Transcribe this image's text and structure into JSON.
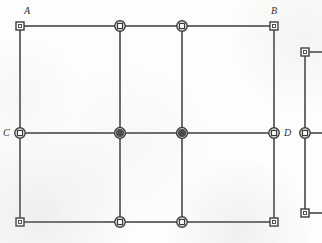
{
  "figure": {
    "kind": "structural-frame-diagram",
    "width": 322,
    "height": 243,
    "background_color": "#fdfdfc",
    "line_color": "#3a3a3a",
    "node_fill_color": "#ffffff",
    "node_filled_color": "#4a4a4a",
    "label_color": "#2e2e2e"
  },
  "labels": [
    {
      "text": "A",
      "x": 24,
      "y": 6,
      "anchor": "above-right"
    },
    {
      "text": "B",
      "x": 271,
      "y": 6,
      "anchor": "above-left"
    },
    {
      "text": "C",
      "x": 3,
      "y": 128,
      "anchor": "left"
    },
    {
      "text": "D",
      "x": 284,
      "y": 128,
      "anchor": "right"
    }
  ],
  "grid": {
    "column_x": [
      20,
      120,
      182,
      274
    ],
    "row_y": [
      26,
      133,
      222
    ]
  },
  "beams": [
    {
      "name": "beam-top",
      "x1": 20,
      "y1": 26,
      "x2": 274,
      "y2": 26
    },
    {
      "name": "beam-middle",
      "x1": 20,
      "y1": 133,
      "x2": 274,
      "y2": 133
    },
    {
      "name": "beam-bottom",
      "x1": 20,
      "y1": 222,
      "x2": 274,
      "y2": 222
    }
  ],
  "columns": [
    {
      "name": "column-1",
      "x1": 20,
      "y1": 26,
      "x2": 20,
      "y2": 222
    },
    {
      "name": "column-2",
      "x1": 120,
      "y1": 26,
      "x2": 120,
      "y2": 222
    },
    {
      "name": "column-3",
      "x1": 182,
      "y1": 26,
      "x2": 182,
      "y2": 222
    },
    {
      "name": "column-4",
      "x1": 274,
      "y1": 26,
      "x2": 274,
      "y2": 222
    }
  ],
  "nodes": [
    {
      "name": "node-A",
      "x": 20,
      "y": 26,
      "marker": "square",
      "label": "A"
    },
    {
      "name": "node-top-2",
      "x": 120,
      "y": 26,
      "marker": "circle-square",
      "label": ""
    },
    {
      "name": "node-top-3",
      "x": 182,
      "y": 26,
      "marker": "circle-square",
      "label": ""
    },
    {
      "name": "node-B",
      "x": 274,
      "y": 26,
      "marker": "square",
      "label": "B"
    },
    {
      "name": "node-C",
      "x": 20,
      "y": 133,
      "marker": "circle-square",
      "label": "C"
    },
    {
      "name": "node-mid-2",
      "x": 120,
      "y": 133,
      "marker": "circle-filled",
      "label": ""
    },
    {
      "name": "node-mid-3",
      "x": 182,
      "y": 133,
      "marker": "circle-filled",
      "label": ""
    },
    {
      "name": "node-D",
      "x": 274,
      "y": 133,
      "marker": "circle-square",
      "label": "D"
    },
    {
      "name": "node-bottom-left",
      "x": 20,
      "y": 222,
      "marker": "square",
      "label": ""
    },
    {
      "name": "node-bottom-2",
      "x": 120,
      "y": 222,
      "marker": "circle-square",
      "label": ""
    },
    {
      "name": "node-bottom-3",
      "x": 182,
      "y": 222,
      "marker": "circle-square",
      "label": ""
    },
    {
      "name": "node-bottom-right",
      "x": 274,
      "y": 222,
      "marker": "square",
      "label": ""
    }
  ],
  "side_fragment": {
    "name": "partial-column-right",
    "column": {
      "x1": 305,
      "y1": 52,
      "x2": 305,
      "y2": 213
    },
    "stubs": [
      {
        "x1": 305,
        "y1": 52,
        "x2": 322,
        "y2": 52
      },
      {
        "x1": 305,
        "y1": 133,
        "x2": 322,
        "y2": 133
      },
      {
        "x1": 305,
        "y1": 213,
        "x2": 322,
        "y2": 213
      }
    ],
    "nodes": [
      {
        "name": "side-node-top",
        "x": 305,
        "y": 52,
        "marker": "square"
      },
      {
        "name": "side-node-middle",
        "x": 305,
        "y": 133,
        "marker": "circle-square"
      },
      {
        "name": "side-node-bottom",
        "x": 305,
        "y": 213,
        "marker": "square"
      }
    ]
  }
}
